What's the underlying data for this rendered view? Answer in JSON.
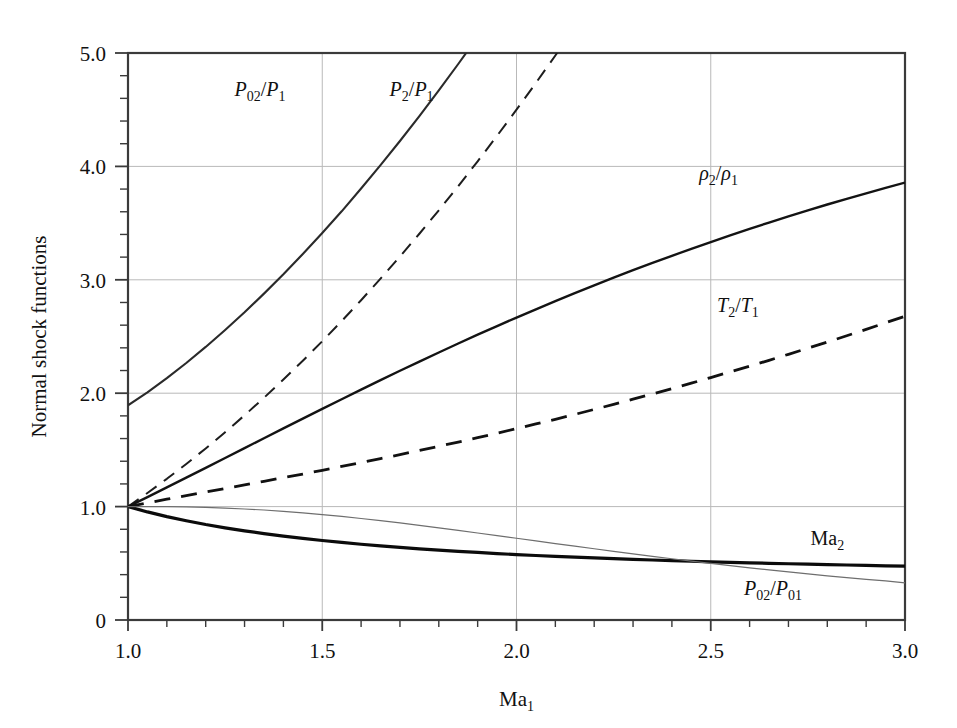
{
  "figure": {
    "background_color": "#ffffff",
    "frame_color": "#3a3a3a",
    "grid_color": "#b9b9b9"
  },
  "chart_data": {
    "type": "line",
    "title": "",
    "xlabel": "Ma",
    "xlabel_sub": "1",
    "ylabel": "Normal shock functions",
    "xlim": [
      1.0,
      3.0
    ],
    "ylim": [
      0,
      5.0
    ],
    "grid": true,
    "legend_position": "inline-labels",
    "x_ticks_major": [
      1.0,
      1.5,
      2.0,
      2.5,
      3.0
    ],
    "x_tick_labels": [
      "1.0",
      "1.5",
      "2.0",
      "2.5",
      "3.0"
    ],
    "x_tick_minor_step": 0.1,
    "y_ticks_major": [
      0,
      1.0,
      2.0,
      3.0,
      4.0,
      5.0
    ],
    "y_tick_labels": [
      "0",
      "1.0",
      "2.0",
      "3.0",
      "4.0",
      "5.0"
    ],
    "y_tick_minor_step": 0.2,
    "gamma": 1.4,
    "x": [
      1.0,
      1.05,
      1.1,
      1.15,
      1.2,
      1.25,
      1.3,
      1.35,
      1.4,
      1.45,
      1.5,
      1.55,
      1.6,
      1.65,
      1.7,
      1.75,
      1.8,
      1.85,
      1.9,
      1.95,
      2.0,
      2.05,
      2.1,
      2.15,
      2.2,
      2.25,
      2.3,
      2.35,
      2.4,
      2.45,
      2.5,
      2.55,
      2.6,
      2.65,
      2.7,
      2.75,
      2.8,
      2.85,
      2.9,
      2.95,
      3.0
    ],
    "series": [
      {
        "name": "P02/P1",
        "label_main": "P",
        "label_sub": "02",
        "label_den": "P",
        "label_den_sub": "1",
        "style": "solid",
        "width": 2.1,
        "color": "#2a2a2a",
        "label_x": 1.34,
        "label_y": 4.62,
        "values": [
          1.893,
          2.008,
          2.133,
          2.266,
          2.408,
          2.558,
          2.714,
          2.878,
          3.049,
          3.228,
          3.413,
          3.604,
          3.805,
          4.011,
          4.224,
          4.443,
          4.67,
          4.903,
          5.142,
          5.389,
          5.64,
          5.9,
          6.165,
          6.438,
          6.716,
          7.002,
          7.294,
          7.592,
          7.897,
          8.208,
          8.526,
          8.85,
          9.181,
          9.519,
          9.862,
          10.213,
          10.569,
          10.932,
          11.302,
          11.678,
          12.061
        ]
      },
      {
        "name": "P2/P1",
        "label_main": "P",
        "label_sub": "2",
        "label_den": "P",
        "label_den_sub": "1",
        "style": "dashed",
        "width": 2.0,
        "color": "#1d1d1d",
        "label_x": 1.73,
        "label_y": 4.62,
        "values": [
          1.0,
          1.12,
          1.245,
          1.376,
          1.513,
          1.656,
          1.805,
          1.96,
          2.12,
          2.286,
          2.458,
          2.636,
          2.82,
          3.01,
          3.205,
          3.406,
          3.613,
          3.826,
          4.045,
          4.27,
          4.5,
          4.736,
          4.978,
          5.226,
          5.48,
          5.74,
          6.005,
          6.276,
          6.553,
          6.836,
          7.125,
          7.42,
          7.72,
          8.026,
          8.338,
          8.656,
          8.98,
          9.31,
          9.645,
          9.986,
          10.333
        ]
      },
      {
        "name": "rho2/rho1",
        "label_main": "ρ",
        "label_sub": "2",
        "label_den": "ρ",
        "label_den_sub": "1",
        "style": "solid",
        "width": 2.4,
        "color": "#131313",
        "label_x": 2.52,
        "label_y": 3.88,
        "values": [
          1.0,
          1.084,
          1.169,
          1.255,
          1.342,
          1.429,
          1.516,
          1.603,
          1.69,
          1.776,
          1.862,
          1.947,
          2.032,
          2.115,
          2.198,
          2.279,
          2.359,
          2.438,
          2.516,
          2.592,
          2.667,
          2.74,
          2.812,
          2.882,
          2.951,
          3.019,
          3.085,
          3.149,
          3.212,
          3.273,
          3.333,
          3.392,
          3.449,
          3.505,
          3.559,
          3.612,
          3.664,
          3.714,
          3.763,
          3.811,
          3.857
        ]
      },
      {
        "name": "T2/T1",
        "label_main": "T",
        "label_sub": "2",
        "label_den": "T",
        "label_den_sub": "1",
        "style": "dashed",
        "width": 2.8,
        "color": "#111111",
        "label_x": 2.57,
        "label_y": 2.72,
        "values": [
          1.0,
          1.033,
          1.065,
          1.097,
          1.128,
          1.159,
          1.191,
          1.223,
          1.255,
          1.287,
          1.32,
          1.354,
          1.388,
          1.423,
          1.458,
          1.495,
          1.532,
          1.569,
          1.608,
          1.647,
          1.688,
          1.729,
          1.77,
          1.813,
          1.857,
          1.901,
          1.947,
          1.993,
          2.04,
          2.088,
          2.138,
          2.188,
          2.238,
          2.29,
          2.343,
          2.397,
          2.451,
          2.507,
          2.563,
          2.621,
          2.679
        ]
      },
      {
        "name": "Ma2",
        "label_main": "Ma",
        "label_sub": "2",
        "label_den": "",
        "label_den_sub": "",
        "style": "solid",
        "width": 3.2,
        "color": "#0b0b0b",
        "label_x": 2.8,
        "label_y": 0.66,
        "values": [
          1.0,
          0.953,
          0.912,
          0.875,
          0.842,
          0.813,
          0.786,
          0.762,
          0.74,
          0.72,
          0.701,
          0.684,
          0.668,
          0.654,
          0.641,
          0.628,
          0.617,
          0.606,
          0.596,
          0.586,
          0.577,
          0.569,
          0.561,
          0.554,
          0.547,
          0.541,
          0.534,
          0.529,
          0.523,
          0.518,
          0.513,
          0.508,
          0.504,
          0.5,
          0.496,
          0.492,
          0.488,
          0.485,
          0.481,
          0.478,
          0.475
        ]
      },
      {
        "name": "P02/P01",
        "label_main": "P",
        "label_sub": "02",
        "label_den": "P",
        "label_den_sub": "01",
        "style": "solid",
        "width": 1.2,
        "color": "#6e6e6e",
        "label_x": 2.66,
        "label_y": 0.22,
        "values": [
          1.0,
          1.0,
          0.999,
          0.997,
          0.993,
          0.987,
          0.979,
          0.97,
          0.958,
          0.945,
          0.93,
          0.913,
          0.895,
          0.876,
          0.856,
          0.835,
          0.813,
          0.79,
          0.767,
          0.744,
          0.721,
          0.698,
          0.674,
          0.651,
          0.628,
          0.606,
          0.583,
          0.561,
          0.54,
          0.519,
          0.499,
          0.479,
          0.46,
          0.442,
          0.424,
          0.407,
          0.389,
          0.374,
          0.359,
          0.345,
          0.328
        ]
      }
    ]
  },
  "layout": {
    "plot_left": 128,
    "plot_right": 905,
    "plot_top": 53,
    "plot_bottom": 620
  }
}
